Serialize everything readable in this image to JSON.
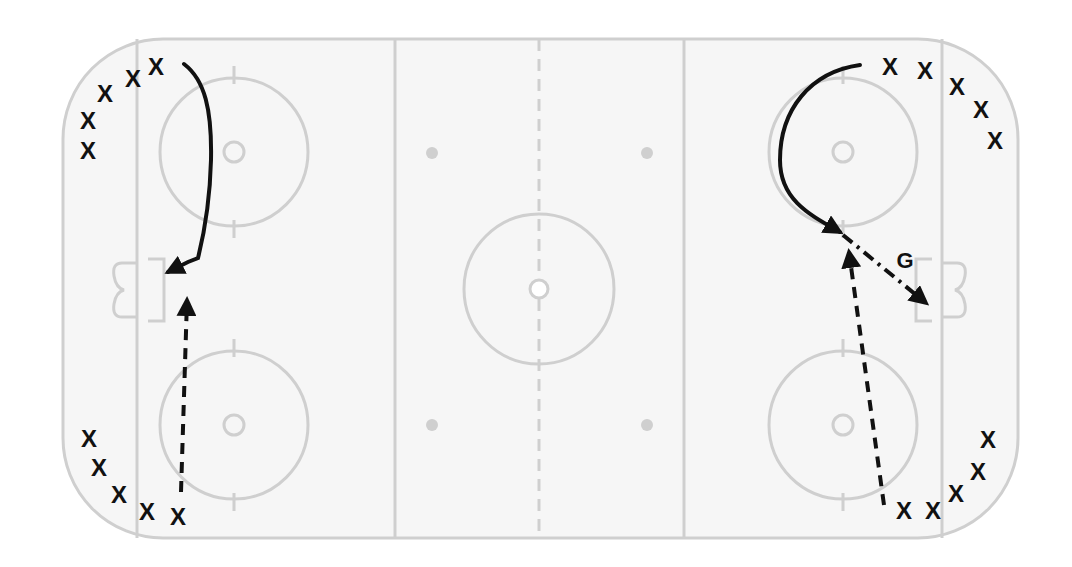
{
  "diagram": {
    "legend_semantics": {
      "player_marker": "X",
      "goalie_label": "G",
      "solid_line": "skating path",
      "dashed_line": "pass",
      "dash_dot_line": "shot"
    },
    "colors": {
      "ice": "#f6f6f6",
      "markings": "#cfcfcf",
      "drill_ink": "#111111"
    },
    "players": [
      {
        "group": "left-top",
        "label": "X"
      },
      {
        "group": "left-top",
        "label": "X"
      },
      {
        "group": "left-top",
        "label": "X"
      },
      {
        "group": "left-top",
        "label": "X"
      },
      {
        "group": "left-top",
        "label": "X"
      },
      {
        "group": "left-bottom",
        "label": "X"
      },
      {
        "group": "left-bottom",
        "label": "X"
      },
      {
        "group": "left-bottom",
        "label": "X"
      },
      {
        "group": "left-bottom",
        "label": "X"
      },
      {
        "group": "left-bottom",
        "label": "X"
      },
      {
        "group": "right-top",
        "label": "X"
      },
      {
        "group": "right-top",
        "label": "X"
      },
      {
        "group": "right-top",
        "label": "X"
      },
      {
        "group": "right-top",
        "label": "X"
      },
      {
        "group": "right-top",
        "label": "X"
      },
      {
        "group": "right-bottom",
        "label": "X"
      },
      {
        "group": "right-bottom",
        "label": "X"
      },
      {
        "group": "right-bottom",
        "label": "X"
      },
      {
        "group": "right-bottom",
        "label": "X"
      },
      {
        "group": "right-bottom",
        "label": "X"
      }
    ],
    "goalie_label": "G",
    "paths": [
      {
        "side": "left",
        "type": "skate",
        "from": "left-top group",
        "to": "front of left net"
      },
      {
        "side": "left",
        "type": "pass",
        "from": "left-bottom group",
        "to": "front of left net"
      },
      {
        "side": "right",
        "type": "skate",
        "from": "right-top group",
        "to": "slot"
      },
      {
        "side": "right",
        "type": "pass",
        "from": "right-bottom group",
        "to": "slot"
      },
      {
        "side": "right",
        "type": "shot",
        "from": "slot",
        "to": "right net"
      }
    ]
  }
}
